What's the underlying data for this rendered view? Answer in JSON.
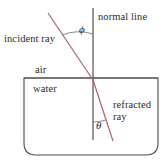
{
  "figure": {
    "width": 168,
    "height": 166,
    "background": "#ffffff",
    "labels": {
      "normal_line": "normal line",
      "incident_ray": "incident ray",
      "air": "air",
      "water": "water",
      "refracted_ray": "refracted ray"
    },
    "symbols": {
      "angle_of_incidence": "ϕ",
      "angle_of_refraction": "θ"
    },
    "colors": {
      "ray": "#a8616e",
      "normal_line": "#5e5e63",
      "container_outline": "#4a4a4a",
      "text": "#2b2b2b",
      "background": "#ffffff"
    },
    "geometry": {
      "normal_line": {
        "x": 93,
        "y_top": 8,
        "y_bottom": 140
      },
      "incident_ray": {
        "x1": 48,
        "y1": 13,
        "x2": 93,
        "y2": 80
      },
      "refracted_ray": {
        "x1": 93,
        "y1": 80,
        "x2": 113,
        "y2": 141
      },
      "water_surface_y": 78,
      "container": {
        "left": 24,
        "top": 78,
        "right": 158,
        "bottom": 155,
        "corner_radius_bottom": 12
      },
      "phi_arc": {
        "center_x": 93,
        "center_y": 80,
        "radius": 46
      },
      "theta_arc": {
        "center_x": 93,
        "center_y": 80,
        "radius": 42
      }
    }
  }
}
